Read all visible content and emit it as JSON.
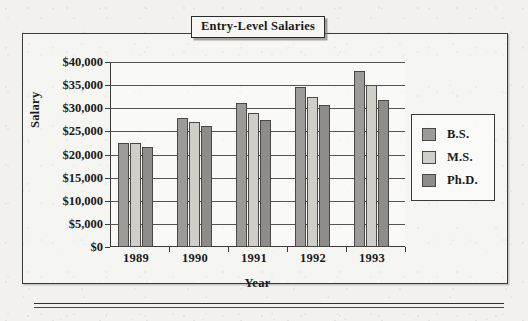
{
  "title": "Entry-Level Salaries",
  "axes": {
    "y_title": "Salary",
    "x_title": "Year",
    "y_ticks": [
      "$40,000",
      "$35,000",
      "$30,000",
      "$25,000",
      "$20,000",
      "$15,000",
      "$10,000",
      "$5,000",
      "$0"
    ]
  },
  "legend": {
    "items": [
      {
        "label": "B.S.",
        "color": "#9c9b97"
      },
      {
        "label": "M.S.",
        "color": "#cfcec9"
      },
      {
        "label": "Ph.D.",
        "color": "#8d8c88"
      }
    ]
  },
  "colors": {
    "bs": "#9c9b97",
    "ms": "#cfcec9",
    "phd": "#8d8c88",
    "frame": "#3a3a38",
    "paper": "#f2f1ee"
  },
  "chart_data": {
    "type": "bar",
    "title": "Entry-Level Salaries",
    "xlabel": "Year",
    "ylabel": "Salary",
    "categories": [
      "1989",
      "1990",
      "1991",
      "1992",
      "1993"
    ],
    "series": [
      {
        "name": "B.S.",
        "values": [
          22500,
          27800,
          31200,
          34700,
          38000
        ]
      },
      {
        "name": "M.S.",
        "values": [
          22500,
          27000,
          29000,
          32500,
          35000
        ]
      },
      {
        "name": "Ph.D.",
        "values": [
          21700,
          26200,
          27500,
          30700,
          31700
        ]
      }
    ],
    "ylim": [
      0,
      40000
    ],
    "ytick_step": 5000,
    "ytick_labels": [
      "$0",
      "$5,000",
      "$10,000",
      "$15,000",
      "$20,000",
      "$25,000",
      "$30,000",
      "$35,000",
      "$40,000"
    ],
    "grid": true,
    "legend_position": "right"
  }
}
